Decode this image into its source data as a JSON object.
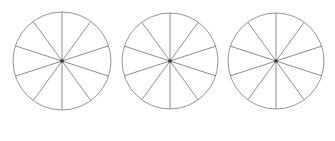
{
  "figure": {
    "background_color": "#ffffff",
    "width": 335,
    "height": 141
  },
  "style": {
    "outline_color": "#888888",
    "spoke_color": "#808080",
    "center_dot_color": "#333333",
    "outline_width": 0.9,
    "spoke_width": 0.9,
    "center_dot_size": 3
  },
  "chart_data": {
    "type": "pie",
    "xlabel": "",
    "ylabel": "",
    "legend": [],
    "annotations": [],
    "grid": false,
    "categories": [
      "1",
      "2",
      "3",
      "4",
      "5",
      "6",
      "7",
      "8",
      "9",
      "10"
    ],
    "values": [
      10,
      10,
      10,
      10,
      10,
      10,
      10,
      10,
      10,
      10
    ],
    "slice_count": 10,
    "slice_angle_degrees": 36,
    "start_angle_degrees": 90,
    "fraction_per_slice": "1/10",
    "shaded_slices": 0,
    "series": [
      {
        "name": "circle-1",
        "values": [
          10,
          10,
          10,
          10,
          10,
          10,
          10,
          10,
          10,
          10
        ]
      },
      {
        "name": "circle-2",
        "values": [
          10,
          10,
          10,
          10,
          10,
          10,
          10,
          10,
          10,
          10
        ]
      },
      {
        "name": "circle-3",
        "values": [
          10,
          10,
          10,
          10,
          10,
          10,
          10,
          10,
          10,
          10
        ]
      }
    ]
  },
  "circles": [
    {
      "name": "circle-1",
      "label": "Circle 1",
      "cx": 62,
      "cy": 61,
      "r": 49,
      "slices": 10
    },
    {
      "name": "circle-2",
      "label": "Circle 2",
      "cx": 170,
      "cy": 61,
      "r": 48,
      "slices": 10
    },
    {
      "name": "circle-3",
      "label": "Circle 3",
      "cx": 276,
      "cy": 61,
      "r": 48,
      "slices": 10
    }
  ]
}
